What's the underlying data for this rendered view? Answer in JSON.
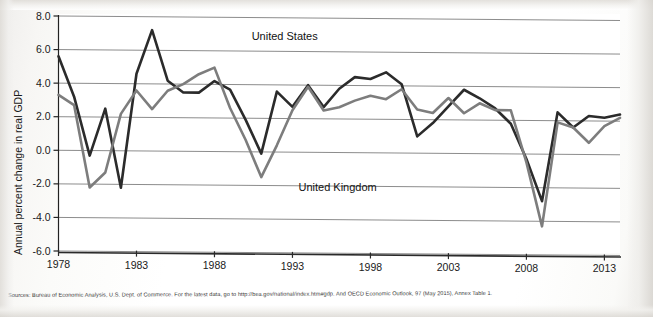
{
  "figure": {
    "background_color": "#ffffff",
    "source_note": "Sources: Bureau of Economic Analysis, U.S. Dept. of Commerce. For the latest data, go to http://bea.gov/national/index.htm#gdp. And OECD Economic Outlook, 97 (May 2015), Annex Table 1."
  },
  "chart_data": {
    "type": "line",
    "title": "",
    "subtitle": "",
    "xlabel": "",
    "ylabel": "Annual percent change in real GDP",
    "xlim": [
      1978,
      2014
    ],
    "ylim": [
      -6.0,
      8.0
    ],
    "grid": true,
    "grid_axis": "y",
    "legend_position": "inline-annotation",
    "x": [
      1978,
      1979,
      1980,
      1981,
      1982,
      1983,
      1984,
      1985,
      1986,
      1987,
      1988,
      1989,
      1990,
      1991,
      1992,
      1993,
      1994,
      1995,
      1996,
      1997,
      1998,
      1999,
      2000,
      2001,
      2002,
      2003,
      2004,
      2005,
      2006,
      2007,
      2008,
      2009,
      2010,
      2011,
      2012,
      2013,
      2014
    ],
    "xticks": [
      1978,
      1983,
      1988,
      1993,
      1998,
      2003,
      2008,
      2013
    ],
    "xtick_labels": [
      "1978",
      "1983",
      "1988",
      "1993",
      "1998",
      "2003",
      "2008",
      "2013"
    ],
    "yticks": [
      8.0,
      6.0,
      4.0,
      2.0,
      0.0,
      -2.0,
      -4.0,
      -6.0
    ],
    "ytick_labels": [
      "8.0",
      "6.0",
      "4.0",
      "2.0",
      "0.0",
      "-2.0",
      "-4.0",
      "-6.0"
    ],
    "series": [
      {
        "name": "United States",
        "color": "#2b2b2b",
        "label_x": 1990,
        "label_y": 6.9,
        "values": [
          5.6,
          3.2,
          -0.3,
          2.5,
          -2.2,
          4.6,
          7.2,
          4.2,
          3.5,
          3.5,
          4.2,
          3.7,
          1.9,
          -0.1,
          3.6,
          2.7,
          4.0,
          2.7,
          3.8,
          4.5,
          4.4,
          4.8,
          4.1,
          1.0,
          1.8,
          2.8,
          3.8,
          3.3,
          2.7,
          1.8,
          -0.3,
          -2.8,
          2.5,
          1.6,
          2.3,
          2.2,
          2.4
        ]
      },
      {
        "name": "United Kingdom",
        "color": "#7d7d7d",
        "label_x": 1993,
        "label_y": -2.1,
        "values": [
          3.3,
          2.7,
          -2.2,
          -1.3,
          2.2,
          3.6,
          2.5,
          3.6,
          4.0,
          4.6,
          5.0,
          2.6,
          0.7,
          -1.5,
          0.4,
          2.5,
          3.9,
          2.5,
          2.7,
          3.1,
          3.4,
          3.2,
          3.8,
          2.6,
          2.4,
          3.3,
          2.4,
          3.0,
          2.6,
          2.6,
          -0.5,
          -4.3,
          1.9,
          1.6,
          0.7,
          1.7,
          2.2
        ]
      }
    ],
    "annotations": [
      {
        "text": "United States",
        "x": 1990,
        "y": 6.9
      },
      {
        "text": "United Kingdom",
        "x": 1993,
        "y": -2.1
      }
    ]
  }
}
